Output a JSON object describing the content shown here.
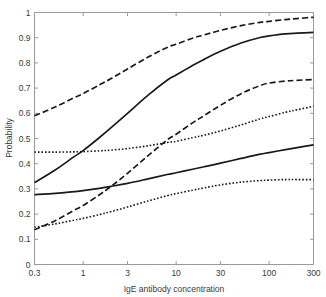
{
  "chart_data": {
    "type": "line",
    "title": "",
    "xlabel": "IgE antibody concentration",
    "ylabel": "Probability",
    "xscale": "log",
    "xlim": [
      0.3,
      300
    ],
    "ylim": [
      0,
      1
    ],
    "grid": false,
    "legend": "none",
    "xticks": [
      "0.3",
      "1",
      "3",
      "10",
      "30",
      "100",
      "300"
    ],
    "xtick_values": [
      0.3,
      1,
      3,
      10,
      30,
      100,
      300
    ],
    "yticks": [
      "0",
      "0.1",
      "0.2",
      "0.3",
      "0.4",
      "0.5",
      "0.6",
      "0.7",
      "0.8",
      "0.9",
      "1"
    ],
    "ytick_values": [
      0,
      0.1,
      0.2,
      0.3,
      0.4,
      0.5,
      0.6,
      0.7,
      0.8,
      0.9,
      1.0
    ],
    "x": [
      0.3,
      0.5,
      0.8,
      1,
      1.5,
      2,
      3,
      5,
      8,
      10,
      15,
      20,
      30,
      50,
      80,
      100,
      150,
      200,
      300
    ],
    "series": [
      {
        "name": "upper-dashed",
        "style": "dashed",
        "color": "#1a1a1a",
        "values": [
          0.59,
          0.625,
          0.662,
          0.678,
          0.713,
          0.738,
          0.776,
          0.823,
          0.861,
          0.874,
          0.898,
          0.911,
          0.929,
          0.948,
          0.961,
          0.965,
          0.972,
          0.976,
          0.981
        ]
      },
      {
        "name": "upper-solid",
        "style": "solid",
        "color": "#1a1a1a",
        "values": [
          0.325,
          0.375,
          0.428,
          0.452,
          0.504,
          0.543,
          0.6,
          0.672,
          0.731,
          0.752,
          0.79,
          0.814,
          0.846,
          0.879,
          0.901,
          0.907,
          0.915,
          0.918,
          0.921
        ]
      },
      {
        "name": "middle-dashed",
        "style": "dashed",
        "color": "#1a1a1a",
        "values": [
          0.138,
          0.174,
          0.215,
          0.234,
          0.277,
          0.31,
          0.362,
          0.432,
          0.494,
          0.517,
          0.562,
          0.591,
          0.632,
          0.678,
          0.71,
          0.72,
          0.728,
          0.731,
          0.734
        ]
      },
      {
        "name": "middle-dotted",
        "style": "dotted",
        "color": "#1a1a1a",
        "values": [
          0.446,
          0.446,
          0.447,
          0.448,
          0.451,
          0.454,
          0.46,
          0.471,
          0.484,
          0.489,
          0.503,
          0.513,
          0.53,
          0.554,
          0.578,
          0.587,
          0.604,
          0.614,
          0.628
        ]
      },
      {
        "name": "lower-solid",
        "style": "solid",
        "color": "#1a1a1a",
        "values": [
          0.277,
          0.282,
          0.289,
          0.293,
          0.302,
          0.31,
          0.322,
          0.34,
          0.357,
          0.364,
          0.378,
          0.388,
          0.402,
          0.421,
          0.438,
          0.444,
          0.456,
          0.464,
          0.475
        ]
      },
      {
        "name": "lower-dotted",
        "style": "dotted",
        "color": "#1a1a1a",
        "values": [
          0.148,
          0.161,
          0.176,
          0.183,
          0.198,
          0.21,
          0.228,
          0.252,
          0.273,
          0.281,
          0.295,
          0.304,
          0.316,
          0.327,
          0.333,
          0.335,
          0.337,
          0.337,
          0.337
        ]
      }
    ]
  },
  "axes": {
    "xlabel": "IgE antibody concentration",
    "ylabel": "Probability"
  }
}
